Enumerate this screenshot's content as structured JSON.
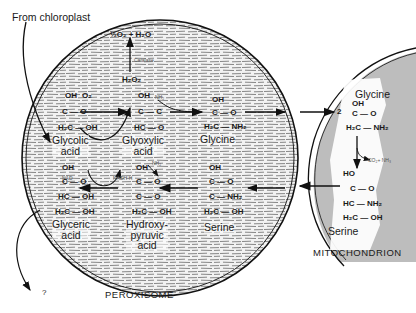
{
  "labels": {
    "from_chloroplast": "From chloroplast",
    "peroxisome": "PEROXISOME",
    "mitochondrion": "MITOCHONDRION",
    "question": "?",
    "o2_h2o": "½O₂ + H₂O",
    "catalase": "Catalase",
    "h2o2": "H₂O₂",
    "o2": "O₂",
    "nh2_in": "NH₂",
    "nad": "NAD",
    "nadh": "NADH·H",
    "nh2_out": "NH₂",
    "co2_nh3": "CO₂+ NH₃",
    "two": "2"
  },
  "compounds": {
    "glycolic": {
      "name_line1": "Glycolic",
      "name_line2": "acid",
      "top": "OH",
      "mid": "C — O",
      "bottom": "H₂C — OH"
    },
    "glyoxylic": {
      "name_line1": "Glyoxylic",
      "name_line2": "acid",
      "top": "OH",
      "mid": "C — C",
      "bottom": "HC — O"
    },
    "glycine_p": {
      "name_line1": "Glycine",
      "top": "OH",
      "mid": "C — O",
      "bottom": "H₂C — NH₂"
    },
    "glyceric": {
      "name_line1": "Glyceric",
      "name_line2": "acid",
      "top": "OH",
      "mid": "C — O",
      "row3": "HC — OH",
      "bottom": "H₂C — OH"
    },
    "hydroxypyruvic": {
      "name_line1": "Hydroxy-",
      "name_line2": "pyruvic",
      "name_line3": "acid",
      "top": "OH",
      "mid": "C — O",
      "row3": "C — O",
      "bottom": "H₂C — OH"
    },
    "serine_p": {
      "name_line1": "Serine",
      "top": "OH",
      "mid": "C — O",
      "row3": "C — NH₂",
      "bottom": "H₂C — OH"
    },
    "glycine_m": {
      "name_line1": "Glycine",
      "top": "OH",
      "mid": "C — O",
      "bottom": "H₂C — NH₂"
    },
    "serine_m": {
      "name_line1": "Serine",
      "top": "HO",
      "mid": "C — O",
      "row3": "HC — NH₂",
      "bottom": "H₂C — OH"
    }
  },
  "colors": {
    "membrane": "#1a1a1a",
    "mito_fill": "#b8b8b8",
    "hatch": "#6a6a6a"
  }
}
